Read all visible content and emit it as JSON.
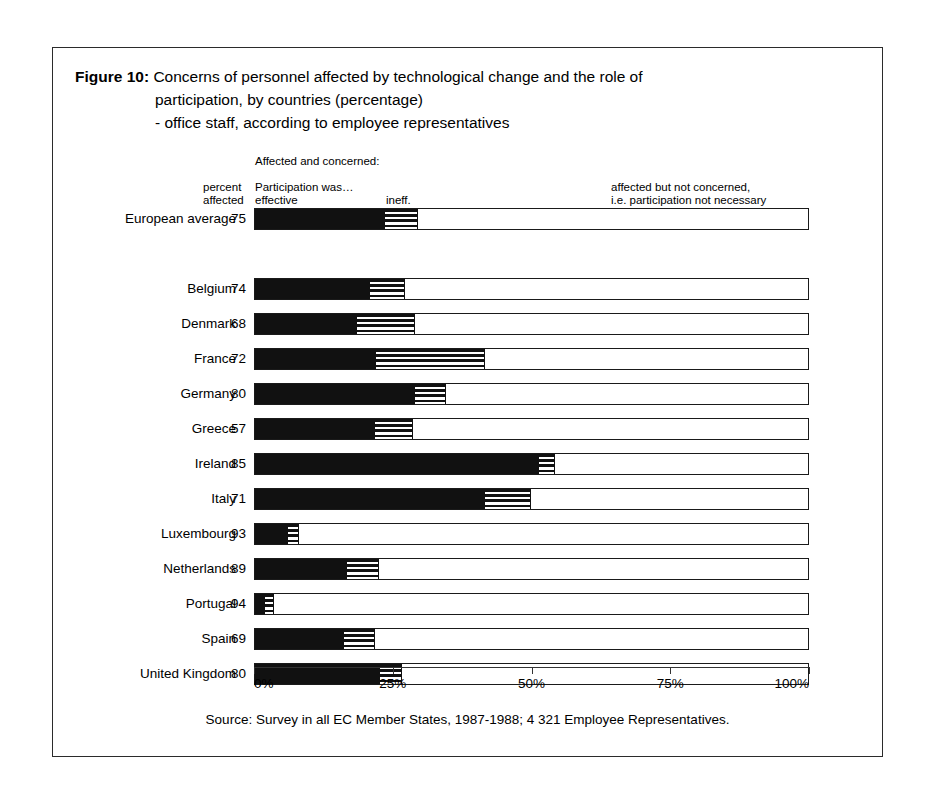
{
  "figure": {
    "label": "Figure 10:",
    "title_line1": "Concerns of personnel affected by technological change and the role of",
    "title_line2": "participation, by countries (percentage)",
    "title_line3": "- office staff, according to employee representatives"
  },
  "legend": {
    "affected_and_concerned": "Affected and concerned:",
    "percent": "percent",
    "affected": "affected",
    "participation_was": "Participation was…",
    "effective": "effective",
    "ineffective": "ineff.",
    "not_concerned_line1": "affected but not concerned,",
    "not_concerned_line2": "i.e. participation not necessary"
  },
  "source": "Source: Survey in all EC Member States, 1987-1988; 4 321 Employee Representatives.",
  "colors": {
    "effective": "#111111",
    "ineffective_stripes": "#111111",
    "not_concerned": "#ffffff",
    "outline": "#1a1a1a",
    "frame": "#2b2b2b"
  },
  "chart_data": {
    "type": "bar",
    "orientation": "horizontal",
    "stacked": true,
    "xlabel": "",
    "ylabel": "",
    "xlim": [
      0,
      100
    ],
    "xticks": [
      0,
      25,
      50,
      75,
      100
    ],
    "xticklabels": [
      "0%",
      "25%",
      "50%",
      "75%",
      "100%"
    ],
    "grid": false,
    "legend_position": "top",
    "value_column_header": "percent affected",
    "series": [
      {
        "name": "Affected and concerned: Participation was effective",
        "key": "effective"
      },
      {
        "name": "Affected and concerned: Participation was ineffective",
        "key": "ineffective"
      },
      {
        "name": "Affected but not concerned, i.e. participation not necessary",
        "key": "not_concerned"
      }
    ],
    "categories": [
      "European average",
      "Belgium",
      "Denmark",
      "France",
      "Germany",
      "Greece",
      "Ireland",
      "Italy",
      "Luxembourg",
      "Netherlands",
      "Portugal",
      "Spain",
      "United Kingdom"
    ],
    "rows": [
      {
        "category": "European average",
        "percent_affected": "75",
        "effective": 23.4,
        "ineffective": 5.9,
        "not_concerned": 70.7,
        "separated": true
      },
      {
        "category": "Belgium",
        "percent_affected": "74",
        "effective": 20.7,
        "ineffective": 6.3,
        "not_concerned": 73.0
      },
      {
        "category": "Denmark",
        "percent_affected": "68",
        "effective": 18.4,
        "ineffective": 10.5,
        "not_concerned": 71.1
      },
      {
        "category": "France",
        "percent_affected": "72",
        "effective": 21.8,
        "ineffective": 19.6,
        "not_concerned": 58.6
      },
      {
        "category": "Germany",
        "percent_affected": "80",
        "effective": 28.8,
        "ineffective": 5.6,
        "not_concerned": 65.6
      },
      {
        "category": "Greece",
        "percent_affected": "57",
        "effective": 21.6,
        "ineffective": 6.8,
        "not_concerned": 71.6
      },
      {
        "category": "Ireland",
        "percent_affected": "85",
        "effective": 51.2,
        "ineffective": 2.9,
        "not_concerned": 45.9
      },
      {
        "category": "Italy",
        "percent_affected": "71",
        "effective": 41.4,
        "ineffective": 8.3,
        "not_concerned": 50.3
      },
      {
        "category": "Luxembourg",
        "percent_affected": "93",
        "effective": 5.9,
        "ineffective": 2.0,
        "not_concerned": 92.1
      },
      {
        "category": "Netherlands",
        "percent_affected": "89",
        "effective": 16.6,
        "ineffective": 5.8,
        "not_concerned": 77.6
      },
      {
        "category": "Portugal",
        "percent_affected": "94",
        "effective": 1.8,
        "ineffective": 1.6,
        "not_concerned": 96.6
      },
      {
        "category": "Spain",
        "percent_affected": "69",
        "effective": 16.0,
        "ineffective": 5.6,
        "not_concerned": 78.4
      },
      {
        "category": "United Kingdom",
        "percent_affected": "80",
        "effective": 22.5,
        "ineffective": 4.0,
        "not_concerned": 73.5
      }
    ]
  }
}
